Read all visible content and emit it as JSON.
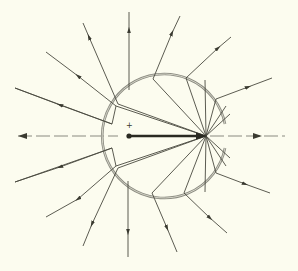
{
  "diagram": {
    "title": "",
    "background": "#fcfcef",
    "line_color": "#4a4a40",
    "arc_color": "#8a8a80",
    "charge_label": "+",
    "charge": {
      "x": 129,
      "y": 136
    },
    "vector": {
      "from": [
        129,
        136
      ],
      "to": [
        206,
        136
      ]
    },
    "sphere": {
      "cx": 180,
      "cy": 136,
      "r": 62,
      "gap": "right"
    },
    "axis": {
      "y": 136,
      "x_start": 15,
      "x_end": 285,
      "style": "dash-dot"
    },
    "outer_rays": [
      {
        "inner": [
          206,
          136
        ],
        "knee": [
          112,
          124
        ],
        "mid": [
          116,
          106
        ],
        "out": [
          15,
          88
        ]
      },
      {
        "inner": [
          206,
          136
        ],
        "knee": [
          116,
          106
        ],
        "out": [
          46,
          52
        ]
      },
      {
        "inner": [
          206,
          136
        ],
        "knee": [
          118,
          104
        ],
        "out": [
          83,
          23
        ]
      },
      {
        "inner": [
          206,
          136
        ],
        "knee": [
          129,
          90
        ],
        "out": [
          129,
          12
        ]
      },
      {
        "inner": [
          206,
          136
        ],
        "knee": [
          153,
          79
        ],
        "out": [
          180,
          16
        ]
      },
      {
        "inner": [
          206,
          136
        ],
        "knee": [
          186,
          78
        ],
        "out": [
          231,
          37
        ]
      },
      {
        "inner": [
          206,
          136
        ],
        "knee": [
          216,
          99
        ],
        "out": [
          272,
          78
        ]
      },
      {
        "inner": [
          206,
          136
        ],
        "knee": [
          112,
          148
        ],
        "mid": [
          116,
          166
        ],
        "out": [
          15,
          182
        ]
      },
      {
        "inner": [
          206,
          136
        ],
        "knee": [
          116,
          166
        ],
        "out": [
          46,
          217
        ]
      },
      {
        "inner": [
          206,
          136
        ],
        "knee": [
          118,
          168
        ],
        "out": [
          83,
          246
        ]
      },
      {
        "inner": [
          206,
          136
        ],
        "knee": [
          128,
          181
        ],
        "out": [
          128,
          257
        ]
      },
      {
        "inner": [
          206,
          136
        ],
        "knee": [
          152,
          193
        ],
        "out": [
          177,
          252
        ]
      },
      {
        "inner": [
          206,
          136
        ],
        "knee": [
          184,
          193
        ],
        "out": [
          227,
          233
        ]
      },
      {
        "inner": [
          206,
          136
        ],
        "knee": [
          216,
          173
        ],
        "out": [
          270,
          193
        ]
      }
    ]
  }
}
